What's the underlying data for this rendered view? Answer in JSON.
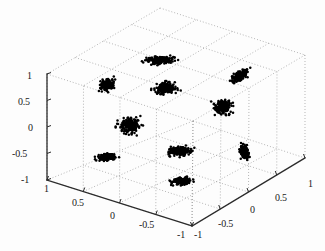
{
  "figure": {
    "kind": "matlab-3d-scatter",
    "background_color": "#fdfdfd",
    "marker_color": "#000000",
    "grid_color": "#8c8c8c",
    "axis_line_color": "#2b2b2b",
    "tick_text_color": "#1a1a1a"
  },
  "chart_data": {
    "type": "scatter",
    "title": "",
    "xlabel": "",
    "ylabel": "",
    "zlabel": "",
    "projection": "3d",
    "grid": true,
    "legend": null,
    "xlim": [
      -1,
      1
    ],
    "ylim": [
      -1,
      1
    ],
    "zlim": [
      -1,
      1
    ],
    "xticks": [
      1,
      0.5,
      0,
      -0.5,
      -1
    ],
    "yticks": [
      -1,
      -0.5,
      0,
      0.5,
      1
    ],
    "zticks": [
      1,
      0.5,
      0,
      -0.5,
      -1
    ],
    "xtick_labels": [
      "1",
      "0.5",
      "0",
      "-0.5",
      "-1"
    ],
    "ytick_labels": [
      "-1",
      "-0.5",
      "0",
      "0.5",
      "1"
    ],
    "ztick_labels": [
      "1",
      "0.5",
      "0",
      "-0.5",
      "-1"
    ],
    "cluster_count": 11,
    "points_per_cluster": 180,
    "clusters": [
      {
        "id": "c1",
        "cx": 160,
        "cy": 60,
        "rx": 14.5,
        "ry": 4.0,
        "rot": -3
      },
      {
        "id": "c2",
        "cx": 240,
        "cy": 76,
        "rx": 10.5,
        "ry": 4.5,
        "rot": -33
      },
      {
        "id": "c3",
        "cx": 107,
        "cy": 85,
        "rx": 8.0,
        "ry": 5.5,
        "rot": -28
      },
      {
        "id": "c4",
        "cx": 166,
        "cy": 88,
        "rx": 12.0,
        "ry": 7.0,
        "rot": -4
      },
      {
        "id": "c5",
        "cx": 223,
        "cy": 107,
        "rx": 9.5,
        "ry": 8.0,
        "rot": 0
      },
      {
        "id": "c6",
        "cx": 130,
        "cy": 125,
        "rx": 11.5,
        "ry": 8.5,
        "rot": 0
      },
      {
        "id": "c7",
        "cx": 180,
        "cy": 151,
        "rx": 13.0,
        "ry": 5.0,
        "rot": -2
      },
      {
        "id": "c8",
        "cx": 244,
        "cy": 152,
        "rx": 4.5,
        "ry": 7.5,
        "rot": -18
      },
      {
        "id": "c9",
        "cx": 107,
        "cy": 157,
        "rx": 10.0,
        "ry": 4.0,
        "rot": -8
      },
      {
        "id": "c10",
        "cx": 182,
        "cy": 181,
        "rx": 11.5,
        "ry": 4.0,
        "rot": -2
      },
      {
        "id": "c11",
        "cx": 230,
        "cy": 120,
        "rx": 0,
        "ry": 0,
        "rot": 0
      }
    ]
  },
  "axes_geometry": {
    "corner_top": {
      "x": 160,
      "y": 8
    },
    "corner_back_left": {
      "x": 47,
      "y": 74
    },
    "corner_back_right": {
      "x": 305,
      "y": 55
    },
    "corner_center": {
      "x": 193,
      "y": 121
    },
    "corner_front_left": {
      "x": 47,
      "y": 180
    },
    "corner_front_right": {
      "x": 305,
      "y": 158
    },
    "corner_bottom": {
      "x": 192,
      "y": 226
    }
  },
  "tick_labels": {
    "z_axis": [
      {
        "text": "1",
        "x": 27,
        "y": 71
      },
      {
        "text": "0.5",
        "x": 18,
        "y": 97
      },
      {
        "text": "0",
        "x": 28,
        "y": 123
      },
      {
        "text": "-0.5",
        "x": 12,
        "y": 149
      },
      {
        "text": "-1",
        "x": 21,
        "y": 175
      }
    ],
    "x_axis_left": [
      {
        "text": "1",
        "x": 44,
        "y": 184
      },
      {
        "text": "0.5",
        "x": 72,
        "y": 198
      },
      {
        "text": "0",
        "x": 110,
        "y": 211
      },
      {
        "text": "-0.5",
        "x": 139,
        "y": 220
      },
      {
        "text": "-1",
        "x": 177,
        "y": 230
      }
    ],
    "y_axis_right": [
      {
        "text": "-1",
        "x": 194,
        "y": 230
      },
      {
        "text": "-0.5",
        "x": 218,
        "y": 219
      },
      {
        "text": "0",
        "x": 250,
        "y": 205
      },
      {
        "text": "0.5",
        "x": 275,
        "y": 193
      },
      {
        "text": "1",
        "x": 308,
        "y": 179
      }
    ]
  }
}
